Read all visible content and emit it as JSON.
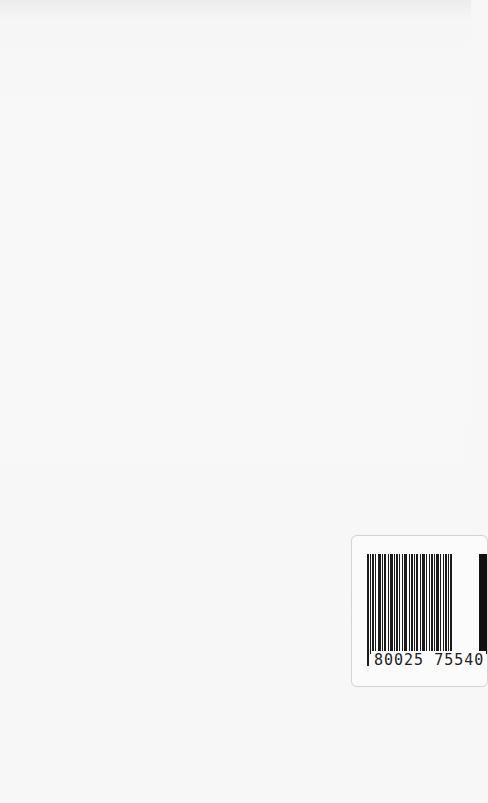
{
  "page": {
    "background": "#f7f7f7"
  },
  "barcode_label": {
    "digits": "80025 75540",
    "bar_color": "#1a1a1a",
    "pattern": [
      2,
      1,
      1,
      1,
      2,
      1,
      1,
      2,
      3,
      1,
      1,
      1,
      2,
      2,
      1,
      1,
      3,
      1,
      1,
      1,
      2,
      1,
      1,
      2,
      1,
      1,
      3,
      2,
      1,
      1,
      2,
      1,
      1,
      1,
      2,
      2,
      1,
      1,
      3,
      1,
      1,
      2,
      1,
      1,
      2,
      1,
      1,
      1,
      3,
      1,
      1,
      2,
      1,
      1,
      2,
      1,
      1,
      1,
      2,
      2
    ]
  }
}
